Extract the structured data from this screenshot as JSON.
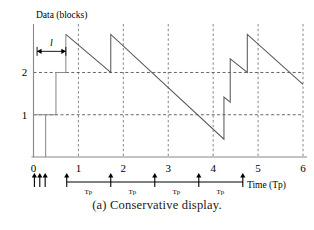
{
  "caption": "(a) Conservative display.",
  "chart_data": {
    "type": "line",
    "title": "",
    "ylabel": "Data (blocks)",
    "xlabel": "Time (Tp)",
    "xlim": [
      0,
      6
    ],
    "ylim": [
      0,
      3.1
    ],
    "grid": true,
    "x_ticks": [
      "0",
      "1",
      "2",
      "3",
      "4",
      "5",
      "6"
    ],
    "x_tick_values": [
      0,
      1,
      2,
      3,
      4,
      5,
      6
    ],
    "y_ticks": [
      "1",
      "2"
    ],
    "y_tick_values": [
      1,
      2
    ],
    "legend": [],
    "annotations": [
      {
        "name": "segment-length",
        "label": "l",
        "x_start": 0.08,
        "x_end": 0.72,
        "y": 2.5
      },
      {
        "name": "interval-tp-1",
        "label": "Tp",
        "x": 1.22
      },
      {
        "name": "interval-tp-2",
        "label": "Tp",
        "x": 2.2
      },
      {
        "name": "interval-tp-3",
        "label": "Tp",
        "x": 3.18
      },
      {
        "name": "interval-tp-4",
        "label": "Tp",
        "x": 4.16
      }
    ],
    "arrival_markers": [
      0.02,
      0.14,
      0.26,
      0.74,
      1.72,
      2.7,
      3.68,
      4.66
    ],
    "timeline_span": {
      "x_start": 0.74,
      "x_end": 4.66
    },
    "series": [
      {
        "name": "startup-staircase",
        "points": [
          [
            0.0,
            2.5
          ],
          [
            0.0,
            0.0
          ],
          [
            0.0,
            1.0
          ],
          [
            0.27,
            1.0
          ],
          [
            0.27,
            0.0
          ],
          [
            0.27,
            1.0
          ],
          [
            0.5,
            1.0
          ],
          [
            0.5,
            2.0
          ],
          [
            0.5,
            2.0
          ],
          [
            0.72,
            2.0
          ],
          [
            0.72,
            2.9
          ]
        ]
      },
      {
        "name": "buffer-occupancy",
        "points": [
          [
            0.72,
            2.9
          ],
          [
            1.72,
            2.0
          ],
          [
            1.72,
            2.9
          ],
          [
            4.24,
            0.42
          ],
          [
            4.24,
            1.42
          ],
          [
            4.38,
            1.3
          ],
          [
            4.38,
            2.32
          ],
          [
            4.76,
            2.0
          ],
          [
            4.76,
            2.9
          ],
          [
            6.0,
            1.72
          ]
        ]
      }
    ]
  }
}
